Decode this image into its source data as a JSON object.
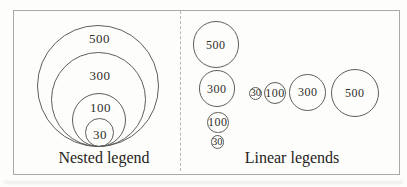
{
  "colors": {
    "stroke": "#5e5e5a",
    "frame_border": "#a9a9a5",
    "divider": "#b6b6b2",
    "text": "#2f2d29",
    "background": "#fdfdfc"
  },
  "nested": {
    "caption": "Nested legend",
    "circles": [
      {
        "value": "500",
        "cx": 98,
        "cy": 86,
        "r": 61,
        "label_x": 99.5,
        "label_y": 38
      },
      {
        "value": "300",
        "cx": 98,
        "cy": 99.5,
        "r": 47.5,
        "label_x": 100,
        "label_y": 75
      },
      {
        "value": "100",
        "cx": 98.5,
        "cy": 120,
        "r": 27,
        "label_x": 100.5,
        "label_y": 107
      },
      {
        "value": "30",
        "cx": 99,
        "cy": 132.5,
        "r": 14.5,
        "label_x": 100,
        "label_y": 133.5
      }
    ]
  },
  "linear": {
    "caption": "Linear legends",
    "column": [
      {
        "value": "500",
        "cx": 215.8,
        "cy": 44.5,
        "r": 23.2
      },
      {
        "value": "300",
        "cx": 216.8,
        "cy": 88.5,
        "r": 18.2
      },
      {
        "value": "100",
        "cx": 217.8,
        "cy": 122.3,
        "r": 10.8
      },
      {
        "value": "30",
        "cx": 217.2,
        "cy": 142,
        "r": 6.6,
        "small": true
      }
    ],
    "row": [
      {
        "value": "30",
        "cx": 255.7,
        "cy": 93.3,
        "r": 6.7,
        "small": true
      },
      {
        "value": "100",
        "cx": 275,
        "cy": 93.3,
        "r": 11
      },
      {
        "value": "300",
        "cx": 307.7,
        "cy": 92.3,
        "r": 18.5
      },
      {
        "value": "500",
        "cx": 354.7,
        "cy": 92.5,
        "r": 24
      }
    ]
  }
}
